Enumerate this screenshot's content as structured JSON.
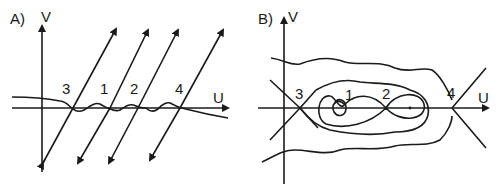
{
  "panels": [
    {
      "id": "A",
      "label": "A)",
      "axes": {
        "x": "U",
        "y": "V"
      },
      "fixed_points": [
        {
          "label": "3",
          "u_order": 1
        },
        {
          "label": "1",
          "u_order": 2
        },
        {
          "label": "2",
          "u_order": 3
        },
        {
          "label": "4",
          "u_order": 4
        }
      ]
    },
    {
      "id": "B",
      "label": "B)",
      "axes": {
        "x": "U",
        "y": "V"
      },
      "fixed_points": [
        {
          "label": "3",
          "u_order": 1
        },
        {
          "label": "1",
          "u_order": 2
        },
        {
          "label": "2",
          "u_order": 3
        },
        {
          "label": "4",
          "u_order": 4
        }
      ]
    }
  ],
  "colors": {
    "ink": "#1a1a1a",
    "background": "#ffffff"
  }
}
